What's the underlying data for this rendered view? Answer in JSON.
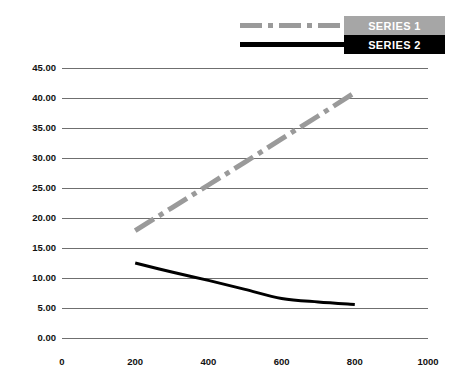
{
  "chart_data": {
    "type": "line",
    "title": "",
    "xlabel": "",
    "ylabel": "",
    "xlim": [
      0,
      1000
    ],
    "ylim": [
      0,
      45
    ],
    "grid": "horizontal",
    "legend_position": "top-right",
    "x_ticks": [
      "0",
      "200",
      "400",
      "600",
      "800",
      "1000"
    ],
    "x_tick_values": [
      0,
      200,
      400,
      600,
      800,
      1000
    ],
    "y_ticks": [
      "0.00",
      "5.00",
      "10.00",
      "15.00",
      "20.00",
      "25.00",
      "30.00",
      "35.00",
      "40.00",
      "45.00"
    ],
    "y_tick_values": [
      0,
      5,
      10,
      15,
      20,
      25,
      30,
      35,
      40,
      45
    ],
    "series": [
      {
        "name": "SERIES 1",
        "color": "#9a9a9a",
        "style": "dash-dot",
        "width": 5,
        "x": [
          200,
          300,
          400,
          500,
          600,
          700,
          800
        ],
        "values": [
          17.9,
          21.7,
          25.5,
          29.3,
          33.2,
          37.0,
          40.9
        ]
      },
      {
        "name": "SERIES 2",
        "color": "#000000",
        "style": "solid",
        "width": 3,
        "x": [
          200,
          300,
          400,
          500,
          600,
          700,
          800
        ],
        "values": [
          12.5,
          11.0,
          9.6,
          8.1,
          6.6,
          6.0,
          5.6
        ]
      }
    ]
  },
  "legend": {
    "entries": [
      {
        "label": "SERIES 1",
        "swatch_bg": "#a6a6a6",
        "line_color": "#9a9a9a",
        "text_color": "#ffffff"
      },
      {
        "label": "SERIES 2",
        "swatch_bg": "#000000",
        "line_color": "#000000",
        "text_color": "#ffffff"
      }
    ]
  },
  "axes": {
    "gridline_color": "#6f6f6f",
    "tick_text_color": "#111111"
  }
}
